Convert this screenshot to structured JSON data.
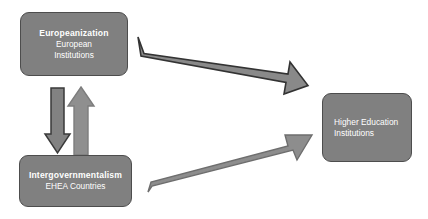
{
  "diagram": {
    "type": "relationship-diagram",
    "nodes": [
      {
        "id": "europeanization",
        "title": "Europeanization",
        "subtitle_line1": "European",
        "subtitle_line2": "Institutions",
        "fill": "#808080",
        "border": "#4d4d4d",
        "text_color": "#ffffff"
      },
      {
        "id": "intergovernmentalism",
        "title": "Intergovernmentalism",
        "subtitle_line1": "EHEA Countries",
        "subtitle_line2": "",
        "fill": "#808080",
        "border": "#4d4d4d",
        "text_color": "#ffffff"
      },
      {
        "id": "higher-education",
        "title": "",
        "subtitle_line1": "Higher Education",
        "subtitle_line2": "Institutions",
        "fill": "#808080",
        "border": "#4d4d4d",
        "text_color": "#ffffff"
      }
    ],
    "arrows": [
      {
        "id": "europeanization-to-intergovernmentalism",
        "direction": "down",
        "from": "europeanization",
        "to": "intergovernmentalism",
        "fill": "#828282",
        "stroke": "#3a3a3a"
      },
      {
        "id": "intergovernmentalism-to-europeanization",
        "direction": "up",
        "from": "intergovernmentalism",
        "to": "europeanization",
        "fill": "#8f8f8f",
        "stroke": "#7d7d7d"
      },
      {
        "id": "europeanization-to-higher-education",
        "direction": "down-right",
        "from": "europeanization",
        "to": "higher-education",
        "fill": "#898989",
        "stroke": "#333333"
      },
      {
        "id": "intergovernmentalism-to-higher-education",
        "direction": "up-right",
        "from": "intergovernmentalism",
        "to": "higher-education",
        "fill": "#8d8d8d",
        "stroke": "#6e6e6e"
      }
    ]
  }
}
